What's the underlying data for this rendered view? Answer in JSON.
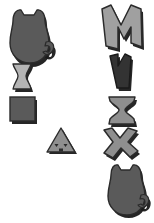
{
  "canvas": {
    "width": 154,
    "height": 223,
    "background": "#ffffff",
    "title": "grayscale shape comparison panel"
  },
  "palette": {
    "shadow": "#1a1a1a",
    "outline_dark": "#2b2b2b",
    "fill_dark": "#5a5a5a",
    "fill_darker": "#333333",
    "fill_light": "#b4b4b4",
    "fill_mid": "#8f8f8f",
    "fill_midlight": "#a0a0a0",
    "background": "#ffffff"
  },
  "columns": {
    "left_label": "left column",
    "right_label": "right column",
    "center_label": "center column"
  },
  "shapes": [
    {
      "id": "cat-large-left",
      "name": "cat-silhouette-shape",
      "column": "left",
      "x": 8,
      "y": 10,
      "width": 44,
      "height": 54,
      "fill": "#5a5a5a",
      "outline": "#2b2b2b",
      "shadow": "#1a1a1a",
      "description": "cat silhouette with ears and curled tail"
    },
    {
      "id": "hourglass-small-left",
      "name": "hourglass-shape",
      "column": "left",
      "x": 12,
      "y": 66,
      "width": 23,
      "height": 27,
      "fill": "#b4b4b4",
      "outline": "#2b2b2b",
      "shadow": "#1a1a1a",
      "description": "small light gray hourglass / bone shape"
    },
    {
      "id": "square-left",
      "name": "square-shape",
      "column": "left",
      "x": 11,
      "y": 99,
      "width": 27,
      "height": 26,
      "fill": "#5a5a5a",
      "outline": "#2b2b2b",
      "shadow": "#1a1a1a",
      "description": "solid gray square"
    },
    {
      "id": "triangle-face-center",
      "name": "triangle-face-shape",
      "column": "center",
      "x": 50,
      "y": 130,
      "width": 30,
      "height": 26,
      "fill": "#8f8f8f",
      "outline": "#2b2b2b",
      "shadow": "#1a1a1a",
      "description": "gray triangle with two eyes and a mouth"
    },
    {
      "id": "letter-m-right",
      "name": "letter-m-shape",
      "column": "right",
      "x": 103,
      "y": 8,
      "width": 46,
      "height": 47,
      "fill": "#a0a0a0",
      "outline": "#2b2b2b",
      "shadow": "#1a1a1a",
      "description": "large letter M shape, light gray"
    },
    {
      "id": "letter-v-right",
      "name": "letter-v-shape",
      "column": "right",
      "x": 111,
      "y": 57,
      "width": 28,
      "height": 39,
      "fill": "#333333",
      "outline": "#1a1a1a",
      "shadow": "#1a1a1a",
      "description": "narrow dark letter V / N shape"
    },
    {
      "id": "hourglass-right",
      "name": "hourglass-shape",
      "column": "right",
      "x": 110,
      "y": 99,
      "width": 30,
      "height": 31,
      "fill": "#8f8f8f",
      "outline": "#2b2b2b",
      "shadow": "#1a1a1a",
      "description": "gray hourglass / bowtie shape"
    },
    {
      "id": "letter-x-right",
      "name": "letter-x-shape",
      "column": "right",
      "x": 105,
      "y": 131,
      "width": 40,
      "height": 35,
      "fill": "#8f8f8f",
      "outline": "#2b2b2b",
      "shadow": "#1a1a1a",
      "description": "thick letter X / asterisk shape"
    },
    {
      "id": "cat-large-right",
      "name": "cat-silhouette-shape",
      "column": "right",
      "x": 106,
      "y": 165,
      "width": 44,
      "height": 52,
      "fill": "#5a5a5a",
      "outline": "#2b2b2b",
      "shadow": "#1a1a1a",
      "description": "cat silhouette with ears and curled tail"
    }
  ]
}
